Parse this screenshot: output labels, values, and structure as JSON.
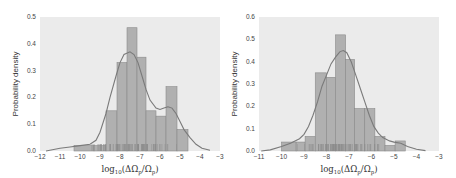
{
  "chart_data": [
    {
      "type": "bar",
      "subtype": "histogram_with_kde_and_rug",
      "title": "",
      "xlabel": "log10(ΔΩp/Ωp)",
      "ylabel": "Probability density",
      "xlim": [
        -12,
        -3
      ],
      "ylim": [
        0,
        0.5
      ],
      "xticks": [
        -12,
        -11,
        -10,
        -9,
        -8,
        -7,
        -6,
        -5,
        -4,
        -3
      ],
      "yticks": [
        0.0,
        0.1,
        0.2,
        0.3,
        0.4,
        0.5
      ],
      "grid": false,
      "background": "#ebebeb",
      "bar_color": "#b0b0b0",
      "line_color": "#7a7a7a",
      "bins": [
        {
          "x0": -10.3,
          "x1": -9.3,
          "density": 0.02
        },
        {
          "x0": -9.3,
          "x1": -8.7,
          "density": 0.02
        },
        {
          "x0": -8.7,
          "x1": -8.15,
          "density": 0.15
        },
        {
          "x0": -8.15,
          "x1": -7.65,
          "density": 0.33
        },
        {
          "x0": -7.65,
          "x1": -7.15,
          "density": 0.46
        },
        {
          "x0": -7.15,
          "x1": -6.7,
          "density": 0.35
        },
        {
          "x0": -6.7,
          "x1": -6.2,
          "density": 0.15
        },
        {
          "x0": -6.2,
          "x1": -5.7,
          "density": 0.13
        },
        {
          "x0": -5.7,
          "x1": -5.15,
          "density": 0.24
        },
        {
          "x0": -5.15,
          "x1": -4.6,
          "density": 0.08
        }
      ],
      "kde": {
        "x": [
          -11.7,
          -11,
          -10.5,
          -10,
          -9.5,
          -9.2,
          -9,
          -8.7,
          -8.5,
          -8.2,
          -8,
          -7.8,
          -7.5,
          -7.3,
          -7.1,
          -6.9,
          -6.7,
          -6.5,
          -6.2,
          -6,
          -5.8,
          -5.6,
          -5.4,
          -5.2,
          -5,
          -4.8,
          -4.5,
          -4.2,
          -3.9,
          -3.5
        ],
        "y": [
          0.0,
          0.01,
          0.015,
          0.02,
          0.025,
          0.04,
          0.07,
          0.14,
          0.2,
          0.28,
          0.33,
          0.36,
          0.37,
          0.36,
          0.33,
          0.28,
          0.23,
          0.19,
          0.16,
          0.155,
          0.16,
          0.165,
          0.16,
          0.14,
          0.11,
          0.08,
          0.05,
          0.025,
          0.01,
          0.003
        ]
      },
      "rug_range": [
        -10.2,
        -4.6
      ]
    },
    {
      "type": "bar",
      "subtype": "histogram_with_kde_and_rug",
      "title": "",
      "xlabel": "log10(ΔΩp/Ωp)",
      "ylabel": "Probability density",
      "xlim": [
        -11,
        -3
      ],
      "ylim": [
        0,
        0.6
      ],
      "xticks": [
        -11,
        -10,
        -9,
        -8,
        -7,
        -6,
        -5,
        -4,
        -3
      ],
      "yticks": [
        0.0,
        0.1,
        0.2,
        0.3,
        0.4,
        0.5,
        0.6
      ],
      "grid": false,
      "background": "#ebebeb",
      "bar_color": "#b0b0b0",
      "line_color": "#7a7a7a",
      "bins": [
        {
          "x0": -10.0,
          "x1": -9.35,
          "density": 0.04
        },
        {
          "x0": -9.35,
          "x1": -8.95,
          "density": 0.04
        },
        {
          "x0": -8.95,
          "x1": -8.5,
          "density": 0.065
        },
        {
          "x0": -8.5,
          "x1": -8.0,
          "density": 0.35
        },
        {
          "x0": -8.0,
          "x1": -7.6,
          "density": 0.33
        },
        {
          "x0": -7.6,
          "x1": -7.15,
          "density": 0.52
        },
        {
          "x0": -7.15,
          "x1": -6.75,
          "density": 0.41
        },
        {
          "x0": -6.75,
          "x1": -6.3,
          "density": 0.19
        },
        {
          "x0": -6.3,
          "x1": -5.85,
          "density": 0.19
        },
        {
          "x0": -5.85,
          "x1": -5.4,
          "density": 0.065
        },
        {
          "x0": -5.4,
          "x1": -4.95,
          "density": 0.025
        },
        {
          "x0": -4.95,
          "x1": -4.5,
          "density": 0.045
        }
      ],
      "kde": {
        "x": [
          -10.9,
          -10.5,
          -10,
          -9.6,
          -9.2,
          -9,
          -8.8,
          -8.6,
          -8.4,
          -8.2,
          -8,
          -7.8,
          -7.6,
          -7.4,
          -7.25,
          -7.1,
          -6.9,
          -6.7,
          -6.5,
          -6.3,
          -6.1,
          -5.9,
          -5.7,
          -5.5,
          -5.2,
          -5,
          -4.7,
          -4.4,
          -4.0,
          -3.6
        ],
        "y": [
          0.0,
          0.005,
          0.02,
          0.035,
          0.055,
          0.075,
          0.11,
          0.16,
          0.22,
          0.29,
          0.34,
          0.39,
          0.42,
          0.445,
          0.45,
          0.44,
          0.4,
          0.34,
          0.28,
          0.22,
          0.16,
          0.11,
          0.08,
          0.06,
          0.045,
          0.04,
          0.035,
          0.02,
          0.008,
          0.002
        ]
      },
      "rug_range": [
        -10.0,
        -4.6
      ]
    }
  ]
}
